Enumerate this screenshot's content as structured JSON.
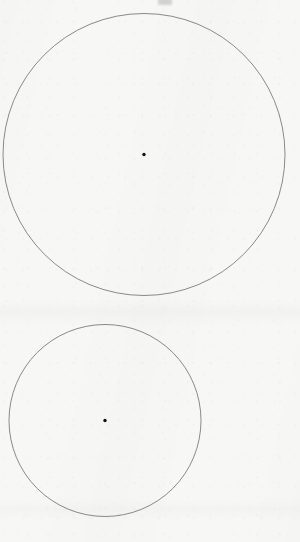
{
  "figure": {
    "background_color": "#f7f7f5",
    "stroke_color": "#5a5a5a",
    "center_dot_color": "#111111",
    "width": 300,
    "height": 542
  },
  "chart_data": {
    "type": "scatter",
    "subtitle": "",
    "xlabel": "",
    "ylabel": "",
    "grid": false,
    "legend": "none",
    "xlim": [
      0,
      300
    ],
    "ylim": [
      0,
      542
    ],
    "shapes": [
      {
        "name": "large-circle",
        "kind": "circle",
        "cx": 144,
        "cy": 154.5,
        "r": 141,
        "diameter": 282,
        "stroke": "#5a5a5a",
        "stroke_width": 0.8,
        "fill": "none"
      },
      {
        "name": "small-circle",
        "kind": "circle",
        "cx": 105,
        "cy": 420.5,
        "r": 96,
        "diameter": 192,
        "stroke": "#5a5a5a",
        "stroke_width": 0.8,
        "fill": "none"
      }
    ],
    "points": [
      {
        "name": "large-circle-centre",
        "x": 144,
        "y": 154.5,
        "r": 1.7,
        "color": "#111111"
      },
      {
        "name": "small-circle-centre",
        "x": 105,
        "y": 420.5,
        "r": 1.7,
        "color": "#111111"
      }
    ],
    "annotations": [
      {
        "name": "top-edge-ink-artifact",
        "x": 165,
        "y": 2,
        "text": ""
      }
    ]
  }
}
